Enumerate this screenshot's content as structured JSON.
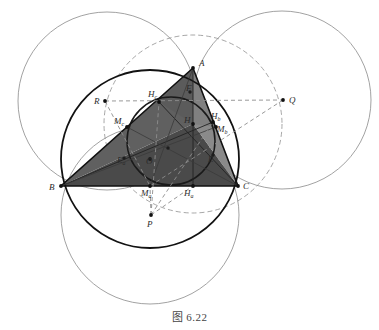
{
  "figure": {
    "caption": "图 6.22",
    "width": 379,
    "height": 330
  },
  "colors": {
    "outline": "#1a1a1a",
    "thin_line": "#777777",
    "dashed_line": "#888888",
    "fill_dark": "#4b4b4b",
    "fill_mid": "#5e5e5e",
    "fill_light": "#8c8c8c",
    "label": "#2b2b2b",
    "caption": "#444444",
    "background": "#ffffff"
  },
  "labels": {
    "A": "A",
    "B": "B",
    "C": "C",
    "H": "H",
    "O": "O",
    "P": "P",
    "Q": "Q",
    "R": "R",
    "E": "E",
    "F": "F",
    "Ha_main": "H",
    "Ha_sub": "a",
    "Hb_main": "H",
    "Hb_sub": "b",
    "Hc_main": "H",
    "Hc_sub": "c",
    "Ma_main": "M",
    "Ma_sub": "a",
    "Mb_main": "M",
    "Mb_sub": "b",
    "Mc_main": "M",
    "Mc_sub": "c",
    "Ea_main": "E",
    "Ea_sub": "a"
  },
  "points": {
    "A": {
      "x": 193,
      "y": 68
    },
    "B": {
      "x": 61,
      "y": 186
    },
    "C": {
      "x": 238,
      "y": 186
    },
    "H": {
      "x": 193,
      "y": 124
    },
    "O": {
      "x": 150,
      "y": 159
    },
    "P": {
      "x": 151,
      "y": 215
    },
    "Q": {
      "x": 283,
      "y": 100
    },
    "R": {
      "x": 105,
      "y": 101
    },
    "Ha": {
      "x": 193,
      "y": 186
    },
    "Hb": {
      "x": 213,
      "y": 122
    },
    "Hc": {
      "x": 159,
      "y": 102
    },
    "Ma": {
      "x": 150,
      "y": 186
    },
    "Mb": {
      "x": 216,
      "y": 127
    },
    "Mc": {
      "x": 127,
      "y": 127
    },
    "E": {
      "x": 213,
      "y": 155
    },
    "F": {
      "x": 190,
      "y": 92
    },
    "Ea": {
      "x": 124,
      "y": 158
    }
  },
  "circles": {
    "circumcircle": {
      "cx": 150,
      "cy": 159,
      "r": 89,
      "label": "circumcircle"
    },
    "nine_point": {
      "cx": 171,
      "cy": 141,
      "r": 44,
      "label": "nine-point-circle"
    },
    "reflect_A": {
      "cx": 107,
      "cy": 101,
      "r": 89,
      "label": "circle-through-B-C-R"
    },
    "reflect_B": {
      "cx": 282,
      "cy": 100,
      "r": 89,
      "label": "circle-through-A-C-Q"
    },
    "reflect_C": {
      "cx": 150,
      "cy": 215,
      "r": 89,
      "label": "circle-through-A-B-P"
    },
    "dashed_big": {
      "cx": 193,
      "cy": 124,
      "r": 89,
      "label": "dashed-circle-center-H"
    }
  },
  "segments": {
    "sides": [
      "AB",
      "BC",
      "CA"
    ],
    "altitudes": [
      "A-Ha",
      "B-Hb",
      "C-Hc"
    ],
    "medians": [
      "A-Ma",
      "B-Mb",
      "C-Mc"
    ],
    "dashed": [
      "R-Q",
      "R-Ma",
      "Q-Ma",
      "P-Hc",
      "P-Hb",
      "P-Ma"
    ]
  }
}
